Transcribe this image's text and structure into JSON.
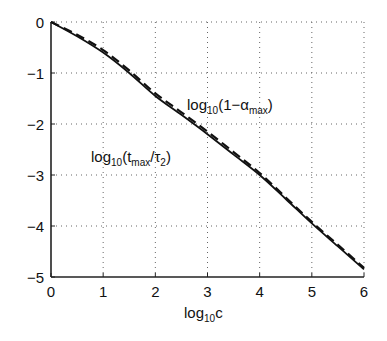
{
  "chart_data": {
    "type": "line",
    "title": "",
    "xlabel": "log10c",
    "xlabel_parts": {
      "base": "log",
      "sub": "10",
      "rest": "c"
    },
    "ylabel": "",
    "xlim": [
      0,
      6
    ],
    "ylim": [
      -5,
      0
    ],
    "grid": true,
    "x_ticks": [
      "0",
      "1",
      "2",
      "3",
      "4",
      "5",
      "6"
    ],
    "y_ticks": [
      "0",
      "−1",
      "−2",
      "−3",
      "−4",
      "−5"
    ],
    "x": [
      0,
      0.5,
      1,
      1.5,
      2,
      2.5,
      3,
      3.5,
      4,
      4.5,
      5,
      5.5,
      6
    ],
    "series": [
      {
        "name": "log10(t_max/τ2)",
        "style": "solid",
        "values": [
          0,
          -0.28,
          -0.6,
          -1.0,
          -1.45,
          -1.82,
          -2.2,
          -2.6,
          -3.0,
          -3.47,
          -3.95,
          -4.4,
          -4.85
        ]
      },
      {
        "name": "log10(1−α_max)",
        "style": "dashed",
        "values": [
          0,
          -0.25,
          -0.55,
          -0.95,
          -1.4,
          -1.77,
          -2.15,
          -2.55,
          -2.96,
          -3.44,
          -3.92,
          -4.37,
          -4.82
        ]
      }
    ],
    "annotations": [
      {
        "text": "log10(t_max/τ2)",
        "parts": {
          "base": "log",
          "sub1": "10",
          "open": "(t",
          "sub2": "max",
          "mid": "/τ",
          "sub3": "2",
          "close": ")"
        },
        "x": 1.5,
        "y": -2.55
      },
      {
        "text": "log10(1−α_max)",
        "parts": {
          "base": "log",
          "sub1": "10",
          "open": "(1−α",
          "sub2": "max",
          "close": ")"
        },
        "x": 3.3,
        "y": -1.6
      }
    ]
  }
}
